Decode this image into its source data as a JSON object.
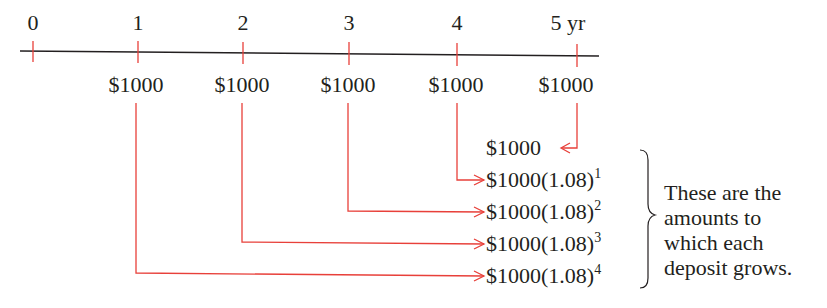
{
  "timeline": {
    "ticks": [
      {
        "label": "0"
      },
      {
        "label": "1"
      },
      {
        "label": "2"
      },
      {
        "label": "3"
      },
      {
        "label": "4"
      },
      {
        "label": "5 yr"
      }
    ],
    "deposits": [
      {
        "year": "1",
        "amount": "$1000"
      },
      {
        "year": "2",
        "amount": "$1000"
      },
      {
        "year": "3",
        "amount": "$1000"
      },
      {
        "year": "4",
        "amount": "$1000"
      },
      {
        "year": "5",
        "amount": "$1000"
      }
    ]
  },
  "results": [
    {
      "base": "$1000",
      "exponent": ""
    },
    {
      "base": "$1000(1.08)",
      "exponent": "1"
    },
    {
      "base": "$1000(1.08)",
      "exponent": "2"
    },
    {
      "base": "$1000(1.08)",
      "exponent": "3"
    },
    {
      "base": "$1000(1.08)",
      "exponent": "4"
    }
  ],
  "annotation": {
    "lines": [
      "These are the",
      "amounts to",
      "which each",
      "deposit grows."
    ]
  },
  "colors": {
    "arrow": "#e8403a",
    "axis": "#231f20",
    "text": "#231f20"
  }
}
